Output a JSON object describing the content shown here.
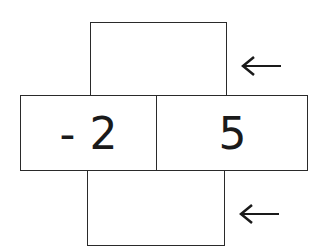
{
  "diagram": {
    "type": "number-cross",
    "boxes": {
      "top": {
        "value": ""
      },
      "middle_left": {
        "value": "- 2"
      },
      "middle_right": {
        "value": "5"
      },
      "bottom": {
        "value": ""
      }
    },
    "arrows": [
      {
        "direction": "left",
        "target": "top"
      },
      {
        "direction": "left",
        "target": "bottom"
      }
    ]
  }
}
